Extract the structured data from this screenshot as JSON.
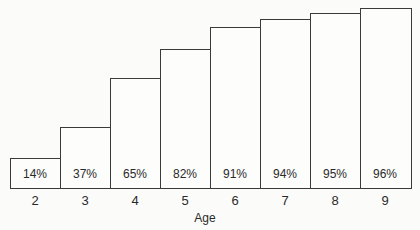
{
  "chart_data": {
    "type": "bar",
    "title": "",
    "xlabel": "Age",
    "ylabel": "",
    "categories": [
      "2",
      "3",
      "4",
      "5",
      "6",
      "7",
      "8",
      "9"
    ],
    "values": [
      14,
      37,
      65,
      82,
      91,
      94,
      95,
      96
    ],
    "value_labels": [
      "14%",
      "37%",
      "65%",
      "82%",
      "91%",
      "94%",
      "95%",
      "96%"
    ],
    "ylim": [
      0,
      100
    ],
    "grid": false,
    "legend": "none",
    "bar_style": "outlined, adjacent (step-like), value labels inside bottom of bars"
  }
}
